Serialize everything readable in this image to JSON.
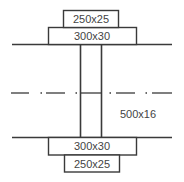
{
  "diagram": {
    "top_plate_outer": {
      "label": "250x25",
      "x": 63,
      "y": 10,
      "w": 55,
      "h": 17
    },
    "top_plate_inner": {
      "label": "300x30",
      "x": 48,
      "y": 27,
      "w": 88,
      "h": 17
    },
    "bottom_plate_inner": {
      "label": "300x30",
      "x": 48,
      "y": 137,
      "w": 88,
      "h": 18
    },
    "bottom_plate_outer": {
      "label": "250x25",
      "x": 64,
      "y": 155,
      "w": 55,
      "h": 17
    },
    "web": {
      "label": "500x16",
      "x_left": 80,
      "x_right": 101,
      "y_top": 44,
      "y_bottom": 137
    },
    "top_flange_line": {
      "x1": 12,
      "x2": 172,
      "y": 44
    },
    "bottom_flange_line": {
      "x1": 12,
      "x2": 172,
      "y": 137
    },
    "centerline": {
      "x1": 11,
      "x2": 172,
      "y": 93,
      "style": "dash-dot"
    },
    "colors": {
      "line": "#3a3a3a",
      "text": "#444444",
      "background": "#ffffff"
    }
  }
}
